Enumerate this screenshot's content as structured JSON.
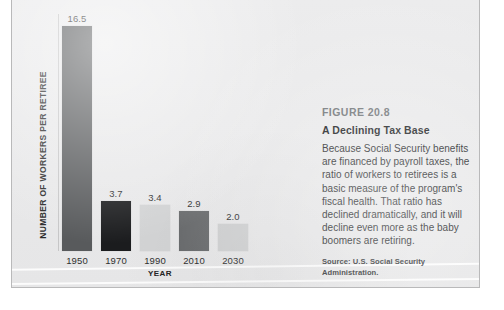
{
  "chart_data": {
    "type": "bar",
    "title": "A Declining Tax Base",
    "figure_number": "FIGURE 20.8",
    "categories": [
      "1950",
      "1970",
      "1990",
      "2010",
      "2030"
    ],
    "values": [
      16.5,
      3.7,
      3.4,
      2.9,
      2.0
    ],
    "value_labels": [
      "16.5",
      "3.7",
      "3.4",
      "2.9",
      "2.0"
    ],
    "bar_colors": [
      "#585a5c",
      "#1b1c1e",
      "#d2d3d4",
      "#6a6c6e",
      "#cfd0d1"
    ],
    "xlabel": "YEAR",
    "ylabel": "NUMBER OF WORKERS PER RETIREE",
    "ylim": [
      0,
      17.4
    ],
    "grid": false,
    "legend": false
  },
  "caption": {
    "figure_number": "FIGURE 20.8",
    "title": "A Declining Tax Base",
    "body": "Because Social Security benefits are financed by payroll taxes, the ratio of workers to retirees is a basic measure of the program's fiscal health. That ratio has declined dramatically, and it will decline even more as the baby boomers are retiring.",
    "source": "Source: U.S. Social Security Administration."
  },
  "colors": {
    "panel_background": "#ececed",
    "panel_border": "#b9b9ba",
    "axis_line": "#c6c6c7",
    "figure_number_text": "#6e7275",
    "title_text": "#16181a",
    "body_text": "#222426"
  }
}
